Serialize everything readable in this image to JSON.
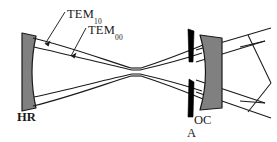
{
  "figure": {
    "background_color": "#ffffff",
    "line_color": "#1a1a1a",
    "mirror_fill": "#808080",
    "mirror_stroke": "#1a1a1a",
    "aperture_fill": "#000000"
  },
  "labels": {
    "tem10": {
      "main": "TEM",
      "sub": "10"
    },
    "tem00": {
      "main": "TEM",
      "sub": "00"
    },
    "hr": "HR",
    "oc": "OC",
    "aperture": "A"
  },
  "components": {
    "hr_mirror": {
      "name": "HR",
      "description": "high reflector concave mirror",
      "x": 22,
      "y": 33,
      "width": 14,
      "height": 78
    },
    "oc_mirror": {
      "name": "OC",
      "description": "output coupler concave mirror",
      "x": 200,
      "y": 35,
      "width": 22,
      "height": 75
    },
    "aperture_upper": {
      "name": "A",
      "x": 188,
      "y": 29,
      "height": 33
    },
    "aperture_lower": {
      "name": "A",
      "x": 188,
      "y": 79,
      "height": 38
    }
  },
  "beams": {
    "tem10": {
      "name": "TEM10 mode envelope",
      "style": "outer hourglass",
      "waist_half_width": 4
    },
    "tem00": {
      "name": "TEM00 mode envelope",
      "style": "inner hourglass",
      "waist_half_width": 3
    },
    "output": {
      "name": "output beam rays",
      "style": "straight chevron lines right of OC"
    }
  }
}
